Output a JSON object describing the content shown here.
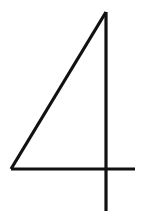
{
  "glyph": {
    "character": "4",
    "stroke_color": "#111111",
    "background": "#ffffff",
    "stroke_width": 3.2
  }
}
